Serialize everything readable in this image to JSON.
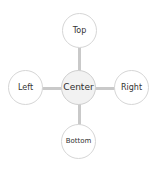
{
  "diagram": {
    "type": "hub-and-spoke",
    "center": {
      "label": "Center"
    },
    "nodes": {
      "top": {
        "label": "Top"
      },
      "left": {
        "label": "Left"
      },
      "right": {
        "label": "Right"
      },
      "bottom": {
        "label": "Bottom"
      }
    },
    "edges": [
      {
        "from": "Center",
        "to": "Top"
      },
      {
        "from": "Center",
        "to": "Left"
      },
      {
        "from": "Center",
        "to": "Right"
      },
      {
        "from": "Center",
        "to": "Bottom"
      }
    ],
    "colors": {
      "connector": "#c9c9c9",
      "node_border": "#d6d6d6",
      "center_fill": "#f2f2f2",
      "node_fill": "#ffffff",
      "text": "#333333"
    }
  }
}
